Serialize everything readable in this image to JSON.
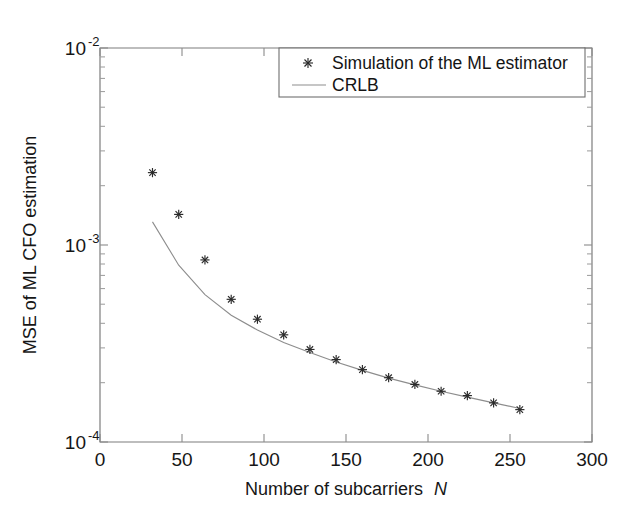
{
  "chart_data": {
    "type": "scatter",
    "title": "",
    "xlabel": "Number of subcarriers N",
    "xlabel_plain": "Number of subcarriers",
    "xlabel_symbol": "N",
    "ylabel": "MSE of ML CFO estimation",
    "xscale": "linear",
    "yscale": "log",
    "xlim": [
      0,
      300
    ],
    "ylim": [
      0.0001,
      0.01
    ],
    "grid": false,
    "xticks": [
      0,
      50,
      100,
      150,
      200,
      250,
      300
    ],
    "xtick_labels": [
      "0",
      "50",
      "100",
      "150",
      "200",
      "250",
      "300"
    ],
    "yticks": [
      0.0001,
      0.001,
      0.01
    ],
    "ytick_labels": [
      "10^-4",
      "10^-3",
      "10^-2"
    ],
    "ytick_mantissa": "10",
    "ytick_exponents": [
      "-4",
      "-3",
      "-2"
    ],
    "legend_position": "upper right",
    "series": [
      {
        "name": "Simulation of the ML estimator",
        "marker": "plus-star",
        "linestyle": "none",
        "color": "#2a2a2a",
        "x": [
          32,
          48,
          64,
          80,
          96,
          112,
          128,
          144,
          160,
          176,
          192,
          208,
          224,
          240,
          256
        ],
        "y": [
          0.00233,
          0.00143,
          0.00084,
          0.00053,
          0.00042,
          0.00035,
          0.000295,
          0.000262,
          0.000233,
          0.000212,
          0.000196,
          0.000181,
          0.000172,
          0.000158,
          0.000146
        ]
      },
      {
        "name": "CRLB",
        "marker": "none",
        "linestyle": "solid",
        "color": "#8d8d8d",
        "x": [
          32,
          48,
          64,
          80,
          96,
          112,
          128,
          144,
          160,
          176,
          192,
          208,
          224,
          240,
          256
        ],
        "y": [
          0.00131,
          0.00079,
          0.00056,
          0.00044,
          0.00037,
          0.00032,
          0.000285,
          0.000255,
          0.000231,
          0.000211,
          0.000195,
          0.000181,
          0.000169,
          0.000158,
          0.000148
        ]
      }
    ],
    "annotations": []
  },
  "legend": {
    "entries": [
      {
        "label": "Simulation of the ML estimator",
        "marker": "plus-star"
      },
      {
        "label": "CRLB",
        "marker": "line"
      }
    ]
  }
}
